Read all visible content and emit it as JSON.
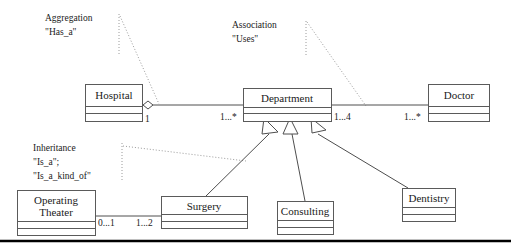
{
  "diagram": {
    "background_color": "#ffffff",
    "box_stroke_color": "#5a5a5a",
    "line_color": "#4e4e4e",
    "leader_color": "#9a9a9a",
    "rule_color": "#000000"
  },
  "classes": [
    {
      "id": "hospital",
      "name": "Hospital"
    },
    {
      "id": "department",
      "name": "Department"
    },
    {
      "id": "doctor",
      "name": "Doctor"
    },
    {
      "id": "operating_theater",
      "name_line1": "Operating",
      "name_line2": "Theater"
    },
    {
      "id": "surgery",
      "name": "Surgery"
    },
    {
      "id": "consulting",
      "name": "Consulting"
    },
    {
      "id": "dentistry",
      "name": "Dentistry"
    }
  ],
  "annotations": [
    {
      "id": "aggregation",
      "line1": "Aggregation",
      "line2": "\"Has_a\""
    },
    {
      "id": "association",
      "line1": "Association",
      "line2": "\"Uses\""
    },
    {
      "id": "inheritance",
      "line1": "Inheritance",
      "line2": "\"Is_a\";",
      "line3": "\"Is_a_kind_of\""
    }
  ],
  "multiplicities": {
    "hospital_end": "1",
    "department_left_end": "1...*",
    "department_right_end": "1...4",
    "doctor_end": "1...*",
    "operating_theater_end": "0...1",
    "surgery_end": "1...2"
  },
  "relationships": [
    {
      "type": "aggregation",
      "from": "Hospital",
      "to": "Department",
      "label": "Has_a"
    },
    {
      "type": "association",
      "from": "Department",
      "to": "Doctor",
      "label": "Uses"
    },
    {
      "type": "association",
      "from": "Operating Theater",
      "to": "Surgery",
      "label": ""
    },
    {
      "type": "inheritance",
      "from": "Surgery",
      "to": "Department",
      "label": "Is_a"
    },
    {
      "type": "inheritance",
      "from": "Consulting",
      "to": "Department",
      "label": "Is_a"
    },
    {
      "type": "inheritance",
      "from": "Dentistry",
      "to": "Department",
      "label": "Is_a"
    }
  ]
}
